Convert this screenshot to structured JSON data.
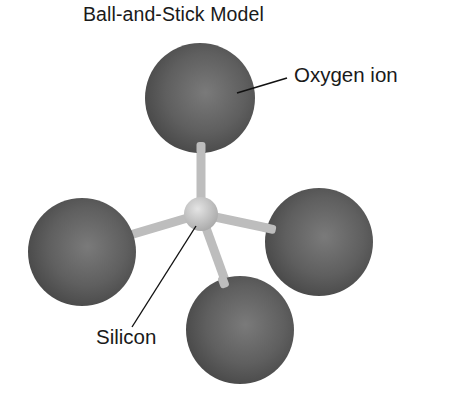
{
  "diagram": {
    "title": "Ball-and-Stick Model",
    "labels": {
      "oxygen": "Oxygen ion",
      "silicon": "Silicon"
    },
    "atoms": [
      {
        "id": "oxygen-top",
        "element": "Oxygen ion",
        "cx": 200,
        "cy": 98,
        "r": 55
      },
      {
        "id": "oxygen-left",
        "element": "Oxygen ion",
        "cx": 82,
        "cy": 252,
        "r": 54
      },
      {
        "id": "oxygen-right",
        "element": "Oxygen ion",
        "cx": 319,
        "cy": 242,
        "r": 54
      },
      {
        "id": "oxygen-bottom",
        "element": "Oxygen ion",
        "cx": 240,
        "cy": 330,
        "r": 54
      },
      {
        "id": "silicon-center",
        "element": "Silicon",
        "cx": 201,
        "cy": 214,
        "r": 17
      }
    ],
    "colors": {
      "oxygen": "#5e5e5e",
      "silicon": "#c8c8c8",
      "stick": "#c4c4c4",
      "text": "#1a1a1a"
    }
  }
}
